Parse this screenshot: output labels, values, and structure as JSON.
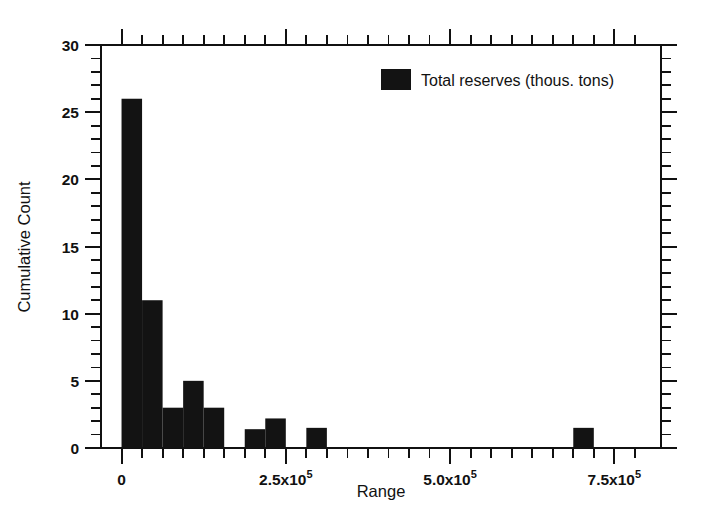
{
  "chart_data": {
    "type": "bar",
    "title": "",
    "subtitle": "",
    "xlabel": "Range",
    "ylabel": "Cumulative Count",
    "xlim": [
      -31250,
      821000
    ],
    "ylim": [
      0,
      30
    ],
    "grid": false,
    "legend": {
      "position": "top-right",
      "entries": [
        {
          "label": "Total reserves (thous. tons)",
          "color": "#131313"
        }
      ]
    },
    "x_tick_labels": [
      {
        "value": 0,
        "text": "0",
        "mantissa": "0",
        "exponent": ""
      },
      {
        "value": 250000,
        "text": "2.5x10^5",
        "mantissa": "2.5x10",
        "exponent": "5"
      },
      {
        "value": 500000,
        "text": "5.0x10^5",
        "mantissa": "5.0x10",
        "exponent": "5"
      },
      {
        "value": 750000,
        "text": "7.5x10^5",
        "mantissa": "7.5x10",
        "exponent": "5"
      }
    ],
    "x_minor_tick_interval": 31250,
    "y_tick_labels": [
      "0",
      "5",
      "10",
      "15",
      "20",
      "25",
      "30"
    ],
    "y_major_tick_interval": 5,
    "y_minor_tick_interval": 1,
    "bin_width": 31250,
    "bins": [
      {
        "x0": 0,
        "x1": 31250,
        "value": 26
      },
      {
        "x0": 31250,
        "x1": 62500,
        "value": 11
      },
      {
        "x0": 62500,
        "x1": 93750,
        "value": 3
      },
      {
        "x0": 93750,
        "x1": 125000,
        "value": 5
      },
      {
        "x0": 125000,
        "x1": 156250,
        "value": 3
      },
      {
        "x0": 156250,
        "x1": 187500,
        "value": 0
      },
      {
        "x0": 187500,
        "x1": 218750,
        "value": 1.4
      },
      {
        "x0": 218750,
        "x1": 250000,
        "value": 2.2
      },
      {
        "x0": 250000,
        "x1": 281250,
        "value": 0
      },
      {
        "x0": 281250,
        "x1": 312500,
        "value": 1.5
      },
      {
        "x0": 312500,
        "x1": 343750,
        "value": 0
      },
      {
        "x0": 343750,
        "x1": 375000,
        "value": 0
      },
      {
        "x0": 375000,
        "x1": 406250,
        "value": 0
      },
      {
        "x0": 406250,
        "x1": 437500,
        "value": 0
      },
      {
        "x0": 437500,
        "x1": 468750,
        "value": 0
      },
      {
        "x0": 468750,
        "x1": 500000,
        "value": 0
      },
      {
        "x0": 500000,
        "x1": 531250,
        "value": 0
      },
      {
        "x0": 531250,
        "x1": 562500,
        "value": 0
      },
      {
        "x0": 562500,
        "x1": 593750,
        "value": 0
      },
      {
        "x0": 593750,
        "x1": 625000,
        "value": 0
      },
      {
        "x0": 625000,
        "x1": 656250,
        "value": 0
      },
      {
        "x0": 656250,
        "x1": 687500,
        "value": 0
      },
      {
        "x0": 687500,
        "x1": 718750,
        "value": 1.5
      },
      {
        "x0": 718750,
        "x1": 750000,
        "value": 0
      },
      {
        "x0": 750000,
        "x1": 781250,
        "value": 0
      }
    ],
    "series": [
      {
        "name": "Total reserves (thous. tons)",
        "color": "#131313",
        "values": [
          26,
          11,
          3,
          5,
          3,
          0,
          1.4,
          2.2,
          0,
          1.5,
          0,
          0,
          0,
          0,
          0,
          0,
          0,
          0,
          0,
          0,
          0,
          0,
          1.5,
          0,
          0
        ]
      }
    ]
  },
  "colors": {
    "bar": "#131313",
    "axis": "#111111",
    "background": "#ffffff"
  }
}
